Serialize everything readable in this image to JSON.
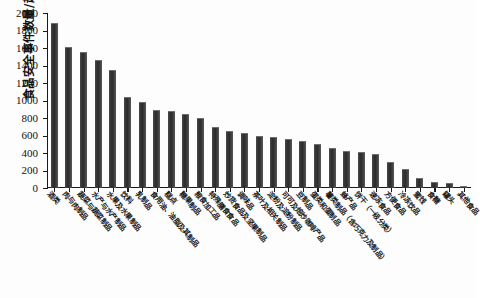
{
  "chart_data": {
    "type": "bar",
    "title": "",
    "xlabel": "",
    "ylabel": "食品安全事件数量/起",
    "ylim": [
      0,
      2000
    ],
    "yticks": [
      0,
      200,
      400,
      600,
      800,
      1000,
      1200,
      1400,
      1600,
      1800,
      2000
    ],
    "grid": false,
    "legend": null,
    "bar_color": "#333333",
    "categories": [
      "酒类",
      "肉与肉制品",
      "蔬菜与蔬菜制品",
      "水产与水产制品",
      "水果及水果制品",
      "饮料",
      "乳制品",
      "食用油、油脂及其制品",
      "糕点",
      "糖果制品",
      "粮食加工品",
      "特殊膳食食品",
      "炒货食品及坚果制品",
      "调味品",
      "茶叶及相关制品",
      "淀粉及淀粉制品",
      "可可及焙炒咖啡产品",
      "豆制品",
      "蛋类和蛋制品",
      "薯类制品（含巧克力及制品）",
      "蜂产品",
      "饼干（一级分类）",
      "速冻食品",
      "方便食品",
      "冷冻饮品",
      "蜜饯",
      "食糖",
      "罐头",
      "其他食品"
    ],
    "values": [
      1890,
      1615,
      1550,
      1465,
      1345,
      1040,
      980,
      890,
      880,
      845,
      805,
      700,
      650,
      625,
      600,
      580,
      560,
      540,
      500,
      460,
      425,
      410,
      390,
      300,
      215,
      110,
      65,
      60,
      25
    ]
  }
}
